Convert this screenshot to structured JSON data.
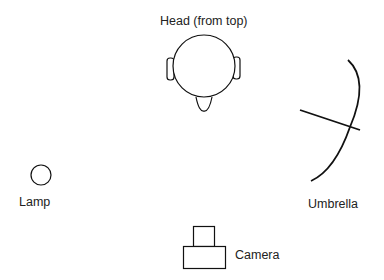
{
  "diagram": {
    "type": "lighting-setup-top-view",
    "labels": {
      "head": "Head (from top)",
      "lamp": "Lamp",
      "umbrella": "Umbrella",
      "camera": "Camera"
    },
    "colors": {
      "stroke": "#111111",
      "text": "#222222",
      "background": "#ffffff"
    }
  }
}
